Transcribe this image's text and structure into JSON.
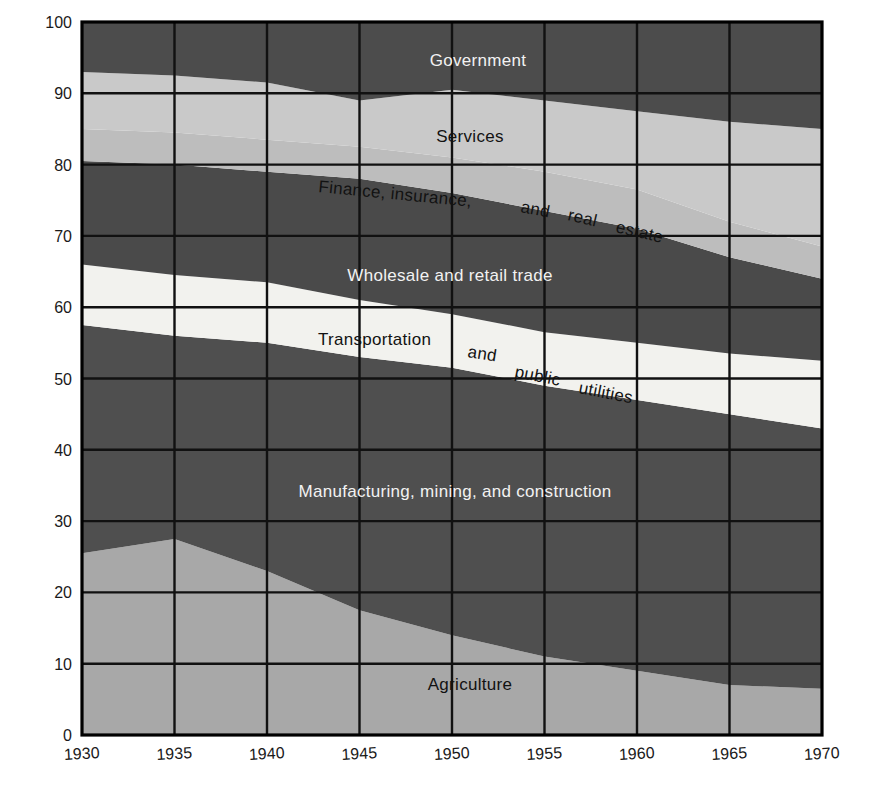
{
  "figure": {
    "ylabel": "Percent of labor force",
    "background": "#ffffff"
  },
  "axes": {
    "y_ticks": [
      "0",
      "10",
      "20",
      "30",
      "40",
      "50",
      "60",
      "70",
      "80",
      "90",
      "100"
    ],
    "x_ticks": [
      "1930",
      "1935",
      "1940",
      "1945",
      "1950",
      "1955",
      "1960",
      "1965",
      "1970"
    ],
    "ylim": [
      0,
      100
    ],
    "xlim": [
      1930,
      1970
    ],
    "grid": true
  },
  "labels": {
    "government": "Government",
    "services": "Services",
    "fire_part1": "Finance, insurance,",
    "fire_part2": "and",
    "fire_part3": "real",
    "fire_part4": "estate",
    "wholesale": "Wholesale and retail trade",
    "transportation_part1": "Transportation",
    "transportation_part2": "and",
    "transportation_part3": "public",
    "transportation_part4": "utilities",
    "manufacturing": "Manufacturing, mining, and construction",
    "agriculture": "Agriculture"
  },
  "colors": {
    "agriculture": "#a8a8a8",
    "manufacturing": "#4f4f4f",
    "transportation": "#f2f2ee",
    "wholesale": "#4a4a4a",
    "fire": "#bdbdbd",
    "services": "#c9c9c9",
    "government": "#4c4c4c",
    "grid": "#111111",
    "axis": "#000000",
    "text_light": "#f2f2f2",
    "text_dark": "#121212"
  },
  "chart_data": {
    "type": "area",
    "title": "",
    "xlabel": "",
    "ylabel": "Percent of labor force",
    "xlim": [
      1930,
      1970
    ],
    "ylim": [
      0,
      100
    ],
    "grid": true,
    "legend": "inline-labels",
    "stacked": true,
    "x": [
      1930,
      1935,
      1940,
      1945,
      1950,
      1955,
      1960,
      1965,
      1970
    ],
    "categories": [
      "1930",
      "1935",
      "1940",
      "1945",
      "1950",
      "1955",
      "1960",
      "1965",
      "1970"
    ],
    "series": [
      {
        "name": "Agriculture",
        "values": [
          25.5,
          27.5,
          23.0,
          17.5,
          14.0,
          11.0,
          9.0,
          7.0,
          6.5
        ],
        "cumulative_top": [
          25.5,
          27.5,
          23.0,
          17.5,
          14.0,
          11.0,
          9.0,
          7.0,
          6.5
        ]
      },
      {
        "name": "Manufacturing, mining, and construction",
        "values": [
          32.0,
          28.5,
          32.0,
          35.5,
          37.5,
          38.0,
          38.0,
          38.0,
          36.5
        ],
        "cumulative_top": [
          57.5,
          56.0,
          55.0,
          53.0,
          51.5,
          49.0,
          47.0,
          45.0,
          43.0
        ]
      },
      {
        "name": "Transportation and public utilities",
        "values": [
          8.5,
          8.5,
          8.5,
          8.0,
          7.5,
          7.5,
          8.0,
          8.5,
          9.5
        ],
        "cumulative_top": [
          66.0,
          64.5,
          63.5,
          61.0,
          59.0,
          56.5,
          55.0,
          53.5,
          52.5
        ]
      },
      {
        "name": "Wholesale and retail trade",
        "values": [
          14.5,
          15.5,
          15.5,
          17.0,
          17.0,
          17.0,
          16.0,
          13.5,
          11.5
        ],
        "cumulative_top": [
          80.5,
          80.0,
          79.0,
          78.0,
          76.0,
          73.5,
          71.0,
          67.0,
          64.0
        ]
      },
      {
        "name": "Finance, insurance, and real estate",
        "values": [
          4.5,
          4.5,
          4.5,
          4.5,
          5.0,
          5.5,
          5.5,
          5.0,
          4.5
        ],
        "cumulative_top": [
          85.0,
          84.5,
          83.5,
          82.5,
          81.0,
          79.0,
          76.5,
          72.0,
          68.5
        ]
      },
      {
        "name": "Services",
        "values": [
          8.0,
          8.0,
          8.0,
          6.5,
          9.5,
          10.0,
          11.0,
          14.0,
          16.5
        ],
        "cumulative_top": [
          93.0,
          92.5,
          91.5,
          89.0,
          90.5,
          89.0,
          87.5,
          86.0,
          85.0
        ]
      },
      {
        "name": "Government",
        "values": [
          7.0,
          7.5,
          8.5,
          11.0,
          9.5,
          11.0,
          12.5,
          14.0,
          15.0
        ],
        "cumulative_top": [
          100,
          100,
          100,
          100,
          100,
          100,
          100,
          100,
          100
        ]
      }
    ]
  }
}
